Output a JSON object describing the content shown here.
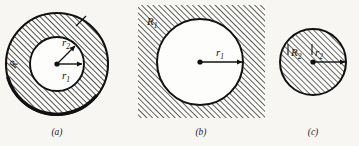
{
  "figure": {
    "background_color": "#f7f6f2",
    "ink_color": "#111111",
    "hatch_color": "#1a1a1a",
    "fill_color": "#fdfdfb",
    "panels": [
      {
        "id": "a",
        "caption": "(a)",
        "shape": "annulus",
        "description": "Hatched annulus between outer circle of radius R and inner white circle of radius r1, with r2 radius arrow inside",
        "labels": [
          {
            "name": "outer-radius-label",
            "text": "R",
            "subscript": ""
          },
          {
            "name": "inner-radius-label-r2",
            "text": "r",
            "subscript": "2"
          },
          {
            "name": "inner-radius-label-r1",
            "text": "r",
            "subscript": "1"
          }
        ],
        "center": {
          "x": 57,
          "y": 64
        },
        "outer_radius": 51,
        "inner_radius": 27,
        "hatched_region": "annulus",
        "caption_position": {
          "x": 57,
          "y": 135
        }
      },
      {
        "id": "b",
        "caption": "(b)",
        "shape": "square-with-circular-hole",
        "description": "Hatched square region R1 containing a white circle of radius r1",
        "labels": [
          {
            "name": "region-label-R1",
            "text": "R",
            "subscript": "1"
          },
          {
            "name": "radius-label-r1",
            "text": "r",
            "subscript": "1"
          }
        ],
        "square": {
          "x": 138,
          "y": 5,
          "width": 127,
          "height": 113
        },
        "center": {
          "x": 200,
          "y": 62
        },
        "radius": 43,
        "hatched_region": "square-minus-circle",
        "caption_position": {
          "x": 201,
          "y": 135
        }
      },
      {
        "id": "c",
        "caption": "(c)",
        "shape": "filled-circle",
        "description": "Fully hatched disk of radius R2 with radius arrow r2 drawn from the center to the edge",
        "labels": [
          {
            "name": "region-label-R2",
            "text": "R",
            "subscript": "2"
          },
          {
            "name": "radius-label-r2",
            "text": "r",
            "subscript": "2"
          }
        ],
        "center": {
          "x": 313,
          "y": 62
        },
        "radius": 33,
        "hatched_region": "whole-disk",
        "caption_position": {
          "x": 313,
          "y": 135
        }
      }
    ],
    "hatch": {
      "angle_degrees": 45,
      "direction": "lower-left to upper-right",
      "spacing_px": 4
    }
  }
}
